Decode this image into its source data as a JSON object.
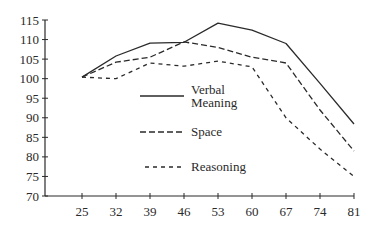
{
  "chart_data": {
    "type": "line",
    "title": "",
    "xlabel": "",
    "ylabel": "",
    "x": [
      25,
      32,
      39,
      46,
      53,
      60,
      67,
      74,
      81
    ],
    "ylim": [
      70,
      115
    ],
    "yticks": [
      70,
      75,
      80,
      85,
      90,
      95,
      100,
      105,
      110,
      115
    ],
    "xticks": [
      25,
      32,
      39,
      46,
      53,
      60,
      67,
      74,
      81
    ],
    "grid": false,
    "legend_position": "center inside plot",
    "series": [
      {
        "name": "Verbal Meaning",
        "style": "solid",
        "values": [
          100.4,
          105.8,
          109.1,
          109.3,
          114.2,
          112.4,
          109.0,
          98.8,
          88.4
        ]
      },
      {
        "name": "Space",
        "style": "long-dash",
        "values": [
          100.4,
          104.2,
          105.5,
          109.4,
          108.0,
          105.5,
          104.0,
          92.0,
          81.5
        ]
      },
      {
        "name": "Reasoning",
        "style": "short-dash",
        "values": [
          100.4,
          100.0,
          104.0,
          103.2,
          104.5,
          103.0,
          90.0,
          82.0,
          75.0
        ]
      }
    ]
  },
  "legend": {
    "verbal_line1": "Verbal",
    "verbal_line2": "Meaning",
    "space": "Space",
    "reasoning": "Reasoning"
  },
  "colors": {
    "line": "#2a2a2a",
    "background": "#ffffff"
  }
}
